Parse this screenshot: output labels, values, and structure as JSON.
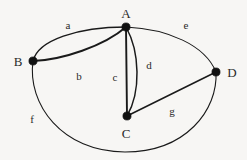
{
  "figure": {
    "kind": "multigraph-diagram",
    "background_color": "#f7f6f4",
    "ink_color": "#1a1a1a",
    "width": 247,
    "height": 160
  },
  "vertices": [
    {
      "id": "A",
      "label": "A",
      "x": 126,
      "y": 27,
      "label_x": 126,
      "label_y": 13
    },
    {
      "id": "B",
      "label": "B",
      "x": 33,
      "y": 61,
      "label_x": 18,
      "label_y": 61
    },
    {
      "id": "C",
      "label": "C",
      "x": 127,
      "y": 116,
      "label_x": 126,
      "label_y": 133
    },
    {
      "id": "D",
      "label": "D",
      "x": 216,
      "y": 72,
      "label_x": 232,
      "label_y": 72
    }
  ],
  "edges": [
    {
      "id": "a",
      "label": "a",
      "from": "B",
      "to": "A",
      "label_x": 68,
      "label_y": 25,
      "shape": "arc-up"
    },
    {
      "id": "b",
      "label": "b",
      "from": "B",
      "to": "A",
      "label_x": 79,
      "label_y": 76,
      "shape": "arc-shallow"
    },
    {
      "id": "c",
      "label": "c",
      "from": "A",
      "to": "C",
      "label_x": 115,
      "label_y": 77,
      "shape": "straight"
    },
    {
      "id": "d",
      "label": "d",
      "from": "A",
      "to": "C",
      "label_x": 149,
      "label_y": 65,
      "shape": "arc-right"
    },
    {
      "id": "e",
      "label": "e",
      "from": "A",
      "to": "D",
      "label_x": 186,
      "label_y": 25,
      "shape": "arc-up"
    },
    {
      "id": "f",
      "label": "f",
      "from": "B",
      "to": "D",
      "label_x": 32,
      "label_y": 119,
      "shape": "arc-bottom"
    },
    {
      "id": "g",
      "label": "g",
      "from": "C",
      "to": "D",
      "label_x": 172,
      "label_y": 111,
      "shape": "straight"
    }
  ]
}
